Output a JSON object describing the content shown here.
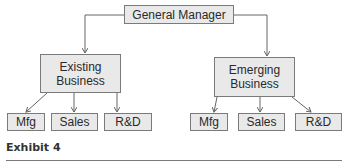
{
  "diagram": {
    "type": "org-chart",
    "root": {
      "label": "General Manager"
    },
    "divisions": [
      {
        "label": "Existing Business",
        "line1": "Existing",
        "line2": "Business",
        "functions": [
          "Mfg",
          "Sales",
          "R&D"
        ]
      },
      {
        "label": "Emerging Business",
        "line1": "Emerging",
        "line2": "Business",
        "functions": [
          "Mfg",
          "Sales",
          "R&D"
        ]
      }
    ]
  },
  "caption": "Exhibit 4",
  "colors": {
    "box_fill": "#e9e9e9",
    "box_border": "#7a7a7a",
    "line": "#666666"
  }
}
